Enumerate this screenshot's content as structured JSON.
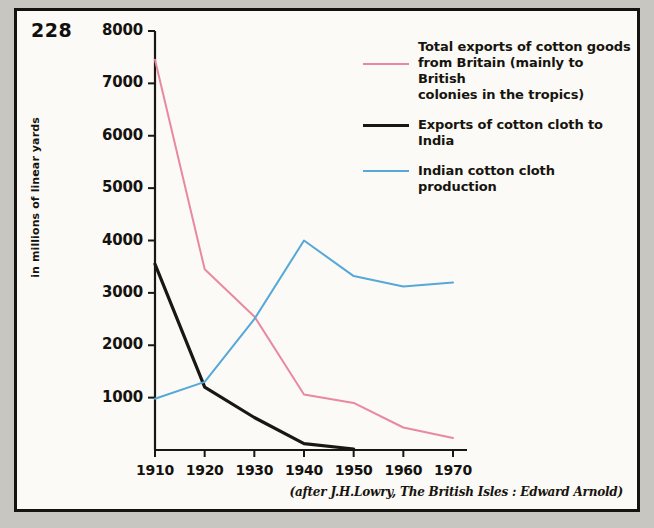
{
  "page_number": "228",
  "caption": "(after J.H.Lowry, The British Isles : Edward Arnold)",
  "axis": {
    "ylabel": "in millions of linear yards"
  },
  "legend": [
    {
      "name": "total-exports-britain",
      "color": "#e8899f",
      "lines": [
        "Total exports of cotton goods",
        "from Britain (mainly to British",
        "colonies in the tropics)"
      ]
    },
    {
      "name": "exports-cotton-cloth-india",
      "color": "#1a1613",
      "lines": [
        "Exports of cotton cloth to India"
      ]
    },
    {
      "name": "indian-cotton-cloth-production",
      "color": "#55a8d8",
      "lines": [
        "Indian cotton cloth production"
      ]
    }
  ],
  "chart_data": {
    "type": "line",
    "title": "",
    "xlabel": "",
    "ylabel": "in millions of linear yards",
    "x": [
      1910,
      1920,
      1930,
      1940,
      1950,
      1960,
      1970
    ],
    "xtick_labels": [
      "1910",
      "1920",
      "1930",
      "1940",
      "1950",
      "1960",
      "1970"
    ],
    "ytick_labels": [
      "1000",
      "2000",
      "3000",
      "4000",
      "5000",
      "6000",
      "7000",
      "8000"
    ],
    "yticks": [
      1000,
      2000,
      3000,
      4000,
      5000,
      6000,
      7000,
      8000
    ],
    "xlim": [
      1910,
      1970
    ],
    "ylim": [
      0,
      8000
    ],
    "grid": false,
    "legend_position": "upper-right",
    "series": [
      {
        "name": "Total exports of cotton goods from Britain (mainly to British colonies in the tropics)",
        "color": "#e8899f",
        "x": [
          1910,
          1920,
          1930,
          1940,
          1950,
          1960,
          1970
        ],
        "values": [
          7450,
          3450,
          2550,
          1060,
          900,
          430,
          230
        ]
      },
      {
        "name": "Exports of cotton cloth to India",
        "color": "#1a1613",
        "x": [
          1910,
          1920,
          1930,
          1940,
          1950
        ],
        "values": [
          3550,
          1200,
          620,
          120,
          20
        ]
      },
      {
        "name": "Indian cotton cloth production",
        "color": "#55a8d8",
        "x": [
          1910,
          1920,
          1930,
          1940,
          1950,
          1960,
          1970
        ],
        "values": [
          980,
          1300,
          2500,
          4000,
          3320,
          3120,
          3200
        ]
      }
    ]
  }
}
